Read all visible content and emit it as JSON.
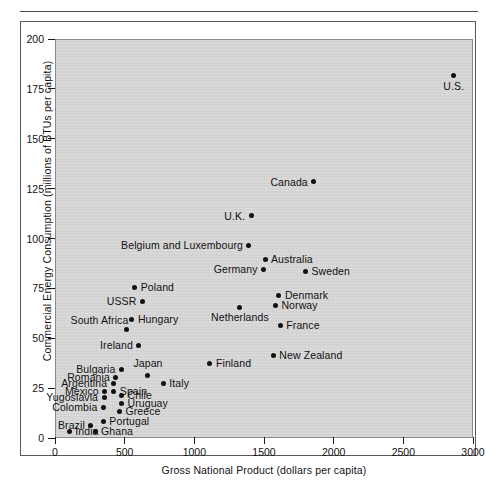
{
  "figure": {
    "xlabel": "Gross National Product (dollars per capita)",
    "ylabel": "Commercial Energy Consumption (millions of BTUs per capita)"
  },
  "axes": {
    "x_ticks": [
      "0",
      "500",
      "1000",
      "1500",
      "2000",
      "2500",
      "3000"
    ],
    "y_ticks": [
      "0",
      "25",
      "50",
      "75",
      "100",
      "125",
      "150",
      "175",
      "200"
    ]
  },
  "chart_data": {
    "type": "scatter",
    "title": "",
    "xlabel": "Gross National Product (dollars per capita)",
    "ylabel": "Commercial Energy Consumption (millions of BTUs per capita)",
    "xlim": [
      0,
      3000
    ],
    "ylim": [
      0,
      200
    ],
    "xticks": [
      0,
      500,
      1000,
      1500,
      2000,
      2500,
      3000
    ],
    "yticks": [
      0,
      25,
      50,
      75,
      100,
      125,
      150,
      175,
      200
    ],
    "grid": false,
    "legend": null,
    "points": [
      {
        "label": "U.S.",
        "x": 2855,
        "y": 182,
        "label_pos": "below"
      },
      {
        "label": "Canada",
        "x": 1850,
        "y": 129,
        "label_pos": "left"
      },
      {
        "label": "U.K.",
        "x": 1400,
        "y": 112,
        "label_pos": "left"
      },
      {
        "label": "Belgium and Luxembourg",
        "x": 1385,
        "y": 97,
        "label_pos": "left"
      },
      {
        "label": "Australia",
        "x": 1500,
        "y": 90,
        "label_pos": "right"
      },
      {
        "label": "Germany",
        "x": 1490,
        "y": 85,
        "label_pos": "left"
      },
      {
        "label": "Sweden",
        "x": 1790,
        "y": 84,
        "label_pos": "right"
      },
      {
        "label": "Poland",
        "x": 565,
        "y": 76,
        "label_pos": "right"
      },
      {
        "label": "Denmark",
        "x": 1600,
        "y": 72,
        "label_pos": "right"
      },
      {
        "label": "USSR",
        "x": 620,
        "y": 69,
        "label_pos": "left"
      },
      {
        "label": "Norway",
        "x": 1575,
        "y": 67,
        "label_pos": "right"
      },
      {
        "label": "Netherlands",
        "x": 1320,
        "y": 66,
        "label_pos": "below"
      },
      {
        "label": "Hungary",
        "x": 545,
        "y": 60,
        "label_pos": "right"
      },
      {
        "label": "France",
        "x": 1610,
        "y": 57,
        "label_pos": "right"
      },
      {
        "label": "South Africa",
        "x": 505,
        "y": 55,
        "label_pos": "above-left"
      },
      {
        "label": "Ireland",
        "x": 595,
        "y": 47,
        "label_pos": "left"
      },
      {
        "label": "New Zealand",
        "x": 1560,
        "y": 42,
        "label_pos": "right"
      },
      {
        "label": "Finland",
        "x": 1105,
        "y": 38,
        "label_pos": "right"
      },
      {
        "label": "Bulgaria",
        "x": 470,
        "y": 35,
        "label_pos": "left"
      },
      {
        "label": "Japan",
        "x": 660,
        "y": 32,
        "label_pos": "above"
      },
      {
        "label": "Romania",
        "x": 430,
        "y": 31,
        "label_pos": "left"
      },
      {
        "label": "Argentina",
        "x": 410,
        "y": 28,
        "label_pos": "left"
      },
      {
        "label": "Italy",
        "x": 770,
        "y": 28,
        "label_pos": "right"
      },
      {
        "label": "Mexico",
        "x": 350,
        "y": 24,
        "label_pos": "left"
      },
      {
        "label": "Spain",
        "x": 415,
        "y": 24,
        "label_pos": "right"
      },
      {
        "label": "Chile",
        "x": 470,
        "y": 22,
        "label_pos": "right"
      },
      {
        "label": "Yugoslavia",
        "x": 345,
        "y": 21,
        "label_pos": "left"
      },
      {
        "label": "Uruguay",
        "x": 470,
        "y": 18,
        "label_pos": "right"
      },
      {
        "label": "Colombia",
        "x": 340,
        "y": 16,
        "label_pos": "left"
      },
      {
        "label": "Greece",
        "x": 455,
        "y": 14,
        "label_pos": "right"
      },
      {
        "label": "Portugal",
        "x": 340,
        "y": 9,
        "label_pos": "right"
      },
      {
        "label": "Brazil",
        "x": 250,
        "y": 7,
        "label_pos": "left"
      },
      {
        "label": "India",
        "x": 95,
        "y": 4,
        "label_pos": "right"
      },
      {
        "label": "Ghana",
        "x": 280,
        "y": 4,
        "label_pos": "right"
      }
    ]
  }
}
